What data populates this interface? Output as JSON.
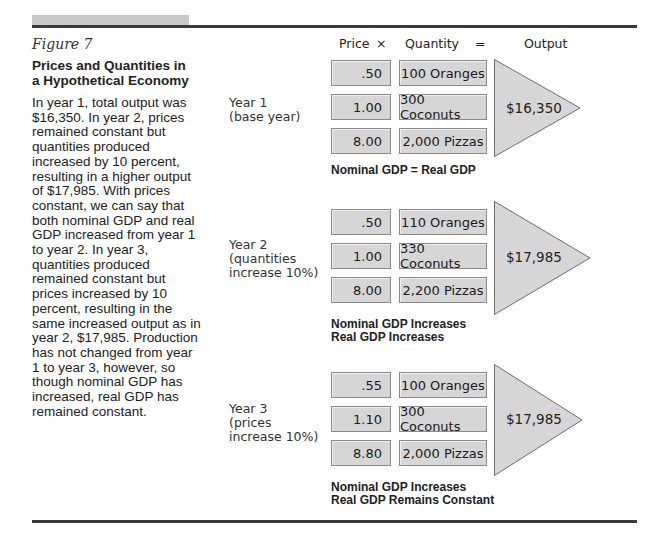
{
  "figure": {
    "label": "Figure 7",
    "title": "Prices and Quantities in a Hypothetical Economy",
    "caption": "In year 1, total output was $16,350. In year 2, prices remained constant but quantities produced increased by 10 percent, resulting in a higher output of $17,985. With prices constant, we can say that both nominal GDP and real GDP increased from year 1 to year 2. In year 3, quantities produced remained constant but prices increased by 10 percent, resulting in the same increased output as in year 2, $17,985. Production has not changed from year 1 to year 3, however, so though nominal GDP has increased, real GDP has remained constant."
  },
  "header": {
    "price": "Price",
    "times": "×",
    "quantity": "Quantity",
    "equals": "=",
    "output": "Output"
  },
  "years": [
    {
      "label": "Year 1\n(base year)",
      "rows": [
        {
          "price": ".50",
          "quantity": "100 Oranges"
        },
        {
          "price": "1.00",
          "quantity": "300 Coconuts"
        },
        {
          "price": "8.00",
          "quantity": "2,000 Pizzas"
        }
      ],
      "output": "$16,350",
      "result": "Nominal GDP = Real GDP"
    },
    {
      "label": "Year 2\n(quantities\nincrease 10%)",
      "rows": [
        {
          "price": ".50",
          "quantity": "110 Oranges"
        },
        {
          "price": "1.00",
          "quantity": "330 Coconuts"
        },
        {
          "price": "8.00",
          "quantity": "2,200 Pizzas"
        }
      ],
      "output": "$17,985",
      "result": "Nominal GDP Increases\nReal GDP Increases"
    },
    {
      "label": "Year 3\n(prices\nincrease 10%)",
      "rows": [
        {
          "price": ".55",
          "quantity": "100 Oranges"
        },
        {
          "price": "1.10",
          "quantity": "300 Coconuts"
        },
        {
          "price": "8.80",
          "quantity": "2,000 Pizzas"
        }
      ],
      "output": "$17,985",
      "result": "Nominal GDP Increases\nReal GDP Remains Constant"
    }
  ],
  "colors": {
    "box_fill": "#d6d6d6",
    "box_border": "#8a8a8a",
    "rule": "#3a3a3a",
    "top_bar": "#c9c9c9"
  }
}
